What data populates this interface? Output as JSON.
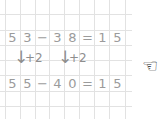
{
  "equations": [
    {
      "cells": [
        "5",
        "3",
        "−",
        "3",
        "8",
        "=",
        "1",
        "5"
      ]
    },
    {
      "cells": [
        "5",
        "5",
        "−",
        "4",
        "0",
        "=",
        "1",
        "5"
      ]
    }
  ],
  "arrows": [
    {
      "glyph": "↓",
      "label": "+2"
    },
    {
      "glyph": "↓",
      "label": "+2"
    }
  ],
  "pointer": {
    "icon": "pointing-hand-left",
    "glyph": "☜"
  },
  "colors": {
    "grid": "#e2e2e2",
    "text": "#9b9b9b",
    "hand": "#222222"
  }
}
